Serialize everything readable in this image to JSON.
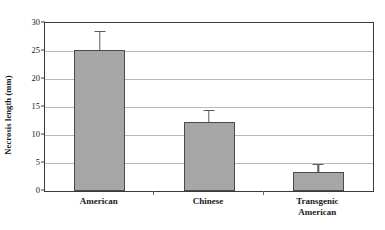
{
  "chart_data": {
    "type": "bar",
    "title": "",
    "subtitle": "",
    "xlabel": "",
    "ylabel": "Necrosis length (mm)",
    "categories": [
      "American",
      "Chinese",
      "Transgenic American"
    ],
    "category_lines": [
      [
        "American"
      ],
      [
        "Chinese"
      ],
      [
        "Transgenic",
        "American"
      ]
    ],
    "values": [
      25.1,
      12.4,
      3.4
    ],
    "errors_upper": [
      3.5,
      2.1,
      1.5
    ],
    "error_top_values": [
      28.6,
      14.5,
      4.9
    ],
    "series": [
      {
        "name": "Necrosis length",
        "values": [
          25.1,
          12.4,
          3.4
        ]
      }
    ],
    "ylim": [
      0,
      30
    ],
    "xlim_note": "categorical",
    "ytick_labels": [
      "0",
      "5",
      "10",
      "15",
      "20",
      "25",
      "30"
    ],
    "ytick_values": [
      0,
      5,
      10,
      15,
      20,
      25,
      30
    ],
    "grid": "horizontal",
    "legend": "none",
    "legend_position": "none",
    "bar_fill_color": "#a6a6a6",
    "bar_edge_color": "#4a4a4a",
    "gridline_color": "#b9b9b9",
    "axis_color": "#3a3a3a",
    "error_bar_color": "#5a5a5a",
    "background_color": "#ffffff",
    "annotations": []
  }
}
